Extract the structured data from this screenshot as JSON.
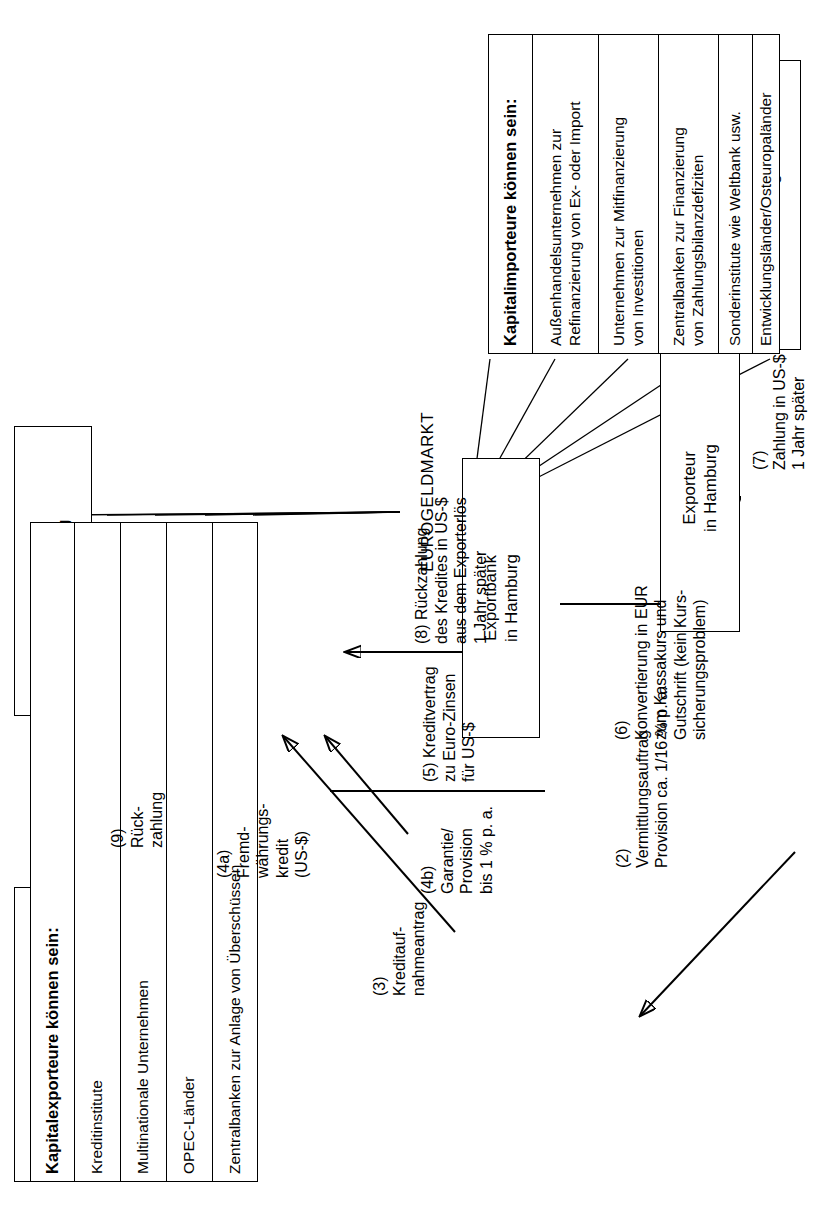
{
  "diagram": {
    "title_text": "EUROGELDMARKT",
    "boxes": {
      "euro_bank_b": "Euro-Bank B\nin London",
      "euro_bank_a": "Euro-Bank A\nin Luxemburg",
      "exportbank": "Exportbank\nin Hamburg",
      "importeur": "Importeur\nin Chicago",
      "exporteur": "Exporteur\nin Hamburg"
    },
    "kapitalexporteure": {
      "heading": "Kapitalexporteure können sein:",
      "items": [
        "Kreditinstitute",
        "Multinationale Unternehmen",
        "OPEC-Länder",
        "Zentralbanken zur Anlage von Überschüssen"
      ]
    },
    "kapitalimporteure": {
      "heading": "Kapitalimporteure können sein:",
      "items": [
        "Außenhandelsunternehmen zur\nRefinanzierung von Ex- oder Import",
        "Unternehmen zur Mitfinanzierung\nvon Investitionen",
        "Zentralbanken zur Finanzierung\nvon Zahlungsbilanzdefiziten",
        "Sonderinstitute wie Weltbank usw.",
        "Entwicklungsländer/Osteuropaländer"
      ]
    },
    "flow_labels": {
      "step1": "(1)\nKaufvertrag\nFaktura US-$\nLieferanten-\nkredit 1 Jahr",
      "step2": "(2)\nVermittlungsauftrag\nProvision ca. 1/16 % p. a.",
      "step3": "(3)\nKreditauf-\nnahmeantrag",
      "step4a": "(4a)\nFremd-\nwährungs-\nkredit\n(US-$)",
      "step4b": "(4b)\nGarantie/\nProvision\nbis 1 % p. a.",
      "step5": "(5) Kreditvertrag\nzu Euro-Zinsen\nfür US-$",
      "step6": "(6)\nKonvertierung in EUR\nzum Kassakurs und\nGutschrift (kein Kurs-\nsicherungsproblem)",
      "step7": "(7)\nZahlung in US-$\n1 Jahr später",
      "step8": "(8) Rückzahlung\ndes Kredites in US-$\naus dem Exporterlös\n1 Jahr später",
      "step9": "(9)\nRück-\nzahlung"
    },
    "colors": {
      "ink": "#000000",
      "paper": "#ffffff"
    }
  }
}
